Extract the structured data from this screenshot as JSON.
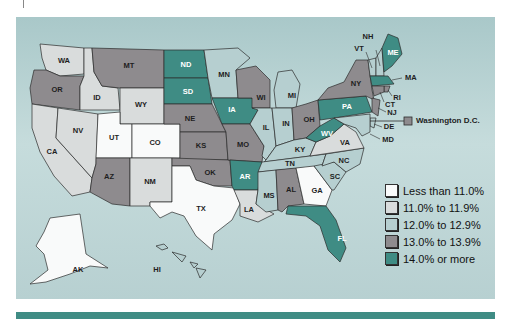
{
  "colors": {
    "lt11": "#f9fafa",
    "11to11_9": "#d9dcdc",
    "12to12_9": "#b6cfd0",
    "13to13_9": "#8e8b8e",
    "14plus": "#3f8c84",
    "background": "#bdd6d7",
    "bar": "#3f8c84"
  },
  "legend": {
    "items": [
      {
        "key": "lt11",
        "label": "Less than 11.0%"
      },
      {
        "key": "11to11_9",
        "label": "11.0% to 11.9%"
      },
      {
        "key": "12to12_9",
        "label": "12.0% to 12.9%"
      },
      {
        "key": "13to13_9",
        "label": "13.0% to 13.9%"
      },
      {
        "key": "14plus",
        "label": "14.0% or more"
      }
    ]
  },
  "dc": {
    "label": "Washington D.C.",
    "category": "13to13_9"
  },
  "states": {
    "WA": "11to11_9",
    "OR": "13to13_9",
    "CA": "11to11_9",
    "NV": "11to11_9",
    "ID": "11to11_9",
    "MT": "13to13_9",
    "WY": "11to11_9",
    "UT": "lt11",
    "CO": "lt11",
    "AZ": "13to13_9",
    "NM": "11to11_9",
    "ND": "14plus",
    "SD": "14plus",
    "NE": "13to13_9",
    "KS": "13to13_9",
    "OK": "13to13_9",
    "TX": "lt11",
    "MN": "12to12_9",
    "IA": "14plus",
    "MO": "13to13_9",
    "AR": "14plus",
    "LA": "11to11_9",
    "WI": "13to13_9",
    "IL": "12to12_9",
    "MI": "12to12_9",
    "IN": "12to12_9",
    "OH": "13to13_9",
    "KY": "12to12_9",
    "TN": "12to12_9",
    "MS": "12to12_9",
    "AL": "13to13_9",
    "GA": "lt11",
    "FL": "14plus",
    "SC": "12to12_9",
    "NC": "12to12_9",
    "VA": "11to11_9",
    "WV": "14plus",
    "PA": "14plus",
    "NY": "13to13_9",
    "VT": "12to12_9",
    "NH": "12to12_9",
    "ME": "14plus",
    "MA": "14plus",
    "RI": "13to13_9",
    "CT": "13to13_9",
    "NJ": "13to13_9",
    "DE": "12to12_9",
    "MD": "12to12_9",
    "AK": "lt11",
    "HI": "12to12_9"
  },
  "labels": {
    "WA": "WA",
    "OR": "OR",
    "CA": "CA",
    "NV": "NV",
    "ID": "ID",
    "MT": "MT",
    "WY": "WY",
    "UT": "UT",
    "CO": "CO",
    "AZ": "AZ",
    "NM": "NM",
    "ND": "ND",
    "SD": "SD",
    "NE": "NE",
    "KS": "KS",
    "OK": "OK",
    "TX": "TX",
    "MN": "MN",
    "IA": "IA",
    "MO": "MO",
    "AR": "AR",
    "LA": "LA",
    "WI": "WI",
    "IL": "IL",
    "MI": "MI",
    "IN": "IN",
    "OH": "OH",
    "KY": "KY",
    "TN": "TN",
    "MS": "MS",
    "AL": "AL",
    "GA": "GA",
    "FL": "FL",
    "SC": "SC",
    "NC": "NC",
    "VA": "VA",
    "WV": "WV",
    "PA": "PA",
    "NY": "NY",
    "VT": "VT",
    "NH": "NH",
    "ME": "ME",
    "MA": "MA",
    "RI": "RI",
    "CT": "CT",
    "NJ": "NJ",
    "DE": "DE",
    "MD": "MD",
    "AK": "AK",
    "HI": "HI"
  }
}
